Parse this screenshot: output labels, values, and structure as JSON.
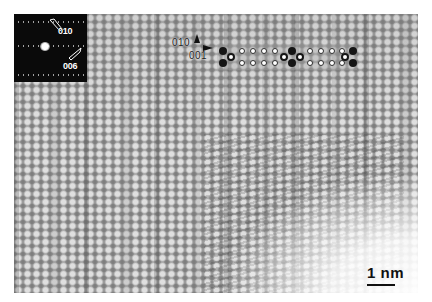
{
  "figure": {
    "type": "HRTEM lattice image",
    "colors": {
      "background": "#ffffff",
      "image_base": "#9c9c9c",
      "inset_background": "#0a0a0a",
      "atom_dark": "#151515"
    }
  },
  "diffraction_inset": {
    "labels": [
      "010",
      "006"
    ]
  },
  "orientation": {
    "axis_up_label": "010",
    "axis_right_label": "001"
  },
  "structure_model": {
    "units": 3,
    "description": "overlay of atomic model: large dark atoms, ringed atoms, and small open circles in two rows"
  },
  "scale_bar": {
    "label": "1 nm"
  }
}
